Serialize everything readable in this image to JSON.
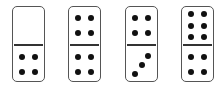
{
  "dominoes": [
    {
      "id": "domino-1",
      "left": 12,
      "top_value": 0,
      "bottom_value": 4
    },
    {
      "id": "domino-2",
      "left": 68,
      "top_value": 4,
      "bottom_value": 4
    },
    {
      "id": "domino-3",
      "left": 125,
      "top_value": 4,
      "bottom_value": 3
    },
    {
      "id": "domino-4",
      "left": 181,
      "top_value": 6,
      "bottom_value": 4
    }
  ],
  "colors": {
    "pip": "#111111",
    "border": "#555555",
    "divider": "#333333",
    "background": "#ffffff"
  }
}
